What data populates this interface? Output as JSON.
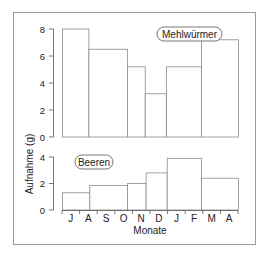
{
  "chart_data": [
    {
      "type": "bar",
      "title": "Mehlwürmer",
      "ylabel": "Aufnahme (g)",
      "xlabel": "Monate",
      "ylim": [
        0,
        8
      ],
      "yticks": [
        0,
        2,
        4,
        6,
        8
      ],
      "months": [
        "J",
        "A",
        "S",
        "O",
        "N",
        "D",
        "J",
        "F",
        "M",
        "A"
      ],
      "bars": [
        {
          "span": [
            "J",
            "A"
          ],
          "x0": 0.0,
          "x1": 1.5,
          "value": 8.0
        },
        {
          "span": [
            "A",
            "O"
          ],
          "x0": 1.5,
          "x1": 3.7,
          "value": 6.5
        },
        {
          "span": [
            "O",
            "N"
          ],
          "x0": 3.7,
          "x1": 4.7,
          "value": 5.2
        },
        {
          "span": [
            "N",
            "D"
          ],
          "x0": 4.7,
          "x1": 5.9,
          "value": 3.2
        },
        {
          "span": [
            "D",
            "F"
          ],
          "x0": 5.9,
          "x1": 7.9,
          "value": 5.2
        },
        {
          "span": [
            "F",
            "A"
          ],
          "x0": 7.9,
          "x1": 10.0,
          "value": 7.2
        }
      ]
    },
    {
      "type": "bar",
      "title": "Beeren",
      "ylabel": "Aufnahme (g)",
      "xlabel": "Monate",
      "ylim": [
        0,
        4
      ],
      "yticks": [
        0,
        2,
        4
      ],
      "months": [
        "J",
        "A",
        "S",
        "O",
        "N",
        "D",
        "J",
        "F",
        "M",
        "A"
      ],
      "bars": [
        {
          "span": [
            "J",
            "A"
          ],
          "x0": 0.0,
          "x1": 1.55,
          "value": 1.3
        },
        {
          "span": [
            "A",
            "O"
          ],
          "x0": 1.55,
          "x1": 3.7,
          "value": 1.85
        },
        {
          "span": [
            "O",
            "N"
          ],
          "x0": 3.7,
          "x1": 4.75,
          "value": 2.0
        },
        {
          "span": [
            "N",
            "D"
          ],
          "x0": 4.75,
          "x1": 5.95,
          "value": 2.8
        },
        {
          "span": [
            "D",
            "F"
          ],
          "x0": 5.95,
          "x1": 7.9,
          "value": 3.9
        },
        {
          "span": [
            "F",
            "A"
          ],
          "x0": 7.9,
          "x1": 10.0,
          "value": 2.4
        }
      ]
    }
  ],
  "labels": {
    "upper_legend": "Mehlwürmer",
    "lower_legend": "Beeren",
    "ylabel": "Aufnahme (g)",
    "xlabel": "Monate"
  },
  "colors": {
    "frame": "#9a9a9a",
    "bar_stroke": "#8a8a8a",
    "axis": "#555555",
    "text": "#222222"
  }
}
